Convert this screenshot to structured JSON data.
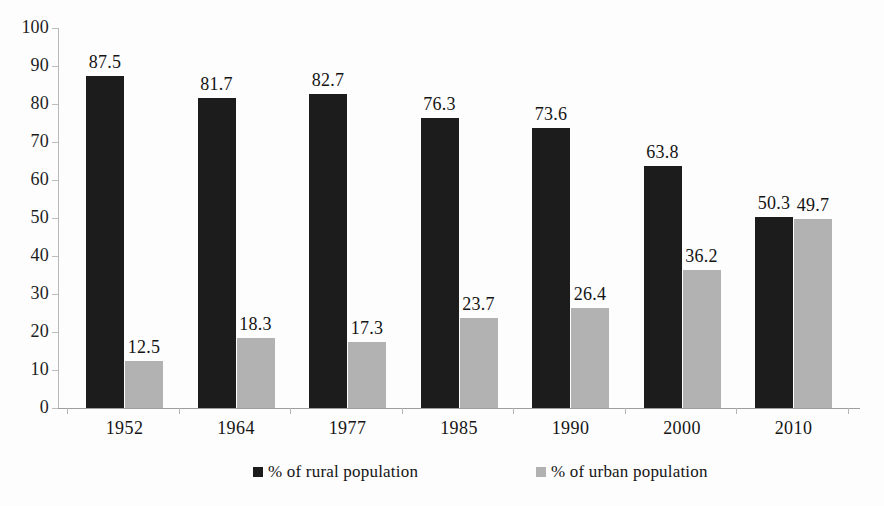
{
  "chart_data": {
    "type": "bar",
    "title": "",
    "subtitle": "",
    "xlabel": "",
    "ylabel": "",
    "ylim": [
      0,
      100
    ],
    "ytick_step": 10,
    "yticks": [
      100,
      90,
      80,
      70,
      60,
      50,
      40,
      30,
      20,
      10,
      0
    ],
    "grid": false,
    "legend_position": "bottom",
    "categories": [
      "1952",
      "1964",
      "1977",
      "1985",
      "1990",
      "2000",
      "2010"
    ],
    "series": [
      {
        "name": "% of rural population",
        "color": "#1c1c1c",
        "values": [
          87.5,
          81.7,
          82.7,
          76.3,
          73.6,
          63.8,
          50.3
        ],
        "labels": [
          "87.5",
          "81.7",
          "82.7",
          "76.3",
          "73.6",
          "63.8",
          "50.3"
        ]
      },
      {
        "name": "% of urban population",
        "color": "#b2b2b2",
        "values": [
          12.5,
          18.3,
          17.3,
          23.7,
          26.4,
          36.2,
          49.7
        ],
        "labels": [
          "12.5",
          "18.3",
          "17.3",
          "23.7",
          "26.4",
          "36.2",
          "49.7"
        ]
      }
    ]
  },
  "legend": {
    "items": [
      {
        "label": "% of rural population",
        "color": "#1c1c1c"
      },
      {
        "label": "% of urban population",
        "color": "#b2b2b2"
      }
    ]
  },
  "axis": {
    "y_labels": [
      "100",
      "90",
      "80",
      "70",
      "60",
      "50",
      "40",
      "30",
      "20",
      "10",
      "0"
    ],
    "x_labels": [
      "1952",
      "1964",
      "1977",
      "1985",
      "1990",
      "2000",
      "2010"
    ]
  },
  "colors": {
    "rural": "#1c1c1c",
    "urban": "#b2b2b2",
    "axis": "#b9b9b9",
    "text": "#141414",
    "background": "#fdfdfd"
  }
}
